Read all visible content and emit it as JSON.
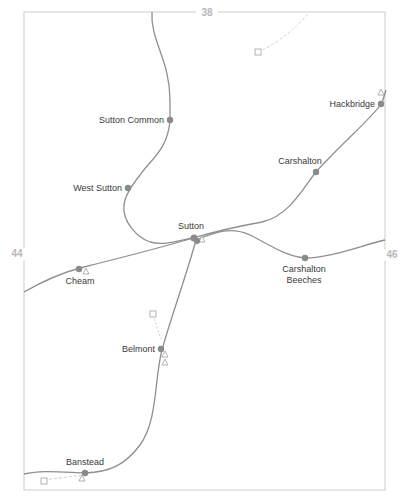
{
  "map": {
    "title": "Sutton area rail map",
    "colors": {
      "line": "#8f8f8f",
      "station": "#8a8a8a",
      "frame": "#cccccc",
      "label": "#3a3a3a",
      "grid_label": "#b8b8b8",
      "marker": "#a0a0a0"
    },
    "grid_labels": {
      "top": "38",
      "left": "44",
      "right": "46"
    },
    "stations": [
      {
        "name": "Hackbridge",
        "label": "Hackbridge"
      },
      {
        "name": "Sutton Common",
        "label": "Sutton Common"
      },
      {
        "name": "Carshalton",
        "label": "Carshalton"
      },
      {
        "name": "West Sutton",
        "label": "West Sutton"
      },
      {
        "name": "Sutton",
        "label": "Sutton"
      },
      {
        "name": "Cheam",
        "label": "Cheam"
      },
      {
        "name": "Carshalton Beeches",
        "label_line1": "Carshalton",
        "label_line2": "Beeches"
      },
      {
        "name": "Belmont",
        "label": "Belmont"
      },
      {
        "name": "Banstead",
        "label": "Banstead"
      }
    ]
  }
}
